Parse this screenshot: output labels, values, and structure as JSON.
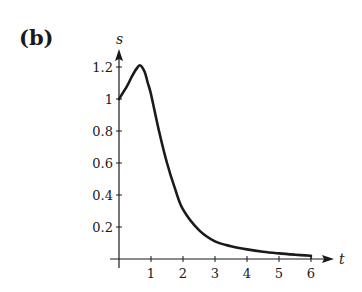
{
  "panel_label": "(b)",
  "chart_data": {
    "type": "line",
    "title": "",
    "xlabel": "t",
    "ylabel": "s",
    "xlim": [
      0,
      6
    ],
    "ylim": [
      0,
      1.2
    ],
    "grid": false,
    "legend": null,
    "x_ticks": [
      "1",
      "2",
      "3",
      "4",
      "5",
      "6"
    ],
    "y_ticks": [
      "0.2",
      "0.4",
      "0.6",
      "0.8",
      "1",
      "1.2"
    ],
    "series": [
      {
        "name": "s(t)",
        "x": [
          0,
          0.25,
          0.4,
          0.55,
          0.66,
          0.8,
          0.9,
          1.0,
          1.25,
          1.5,
          1.75,
          2.0,
          2.5,
          3.0,
          3.5,
          4.0,
          4.5,
          5.0,
          5.5,
          6.0
        ],
        "values": [
          1.0,
          1.08,
          1.14,
          1.19,
          1.21,
          1.17,
          1.1,
          1.03,
          0.8,
          0.6,
          0.44,
          0.31,
          0.18,
          0.11,
          0.08,
          0.06,
          0.045,
          0.035,
          0.027,
          0.02
        ]
      }
    ]
  }
}
